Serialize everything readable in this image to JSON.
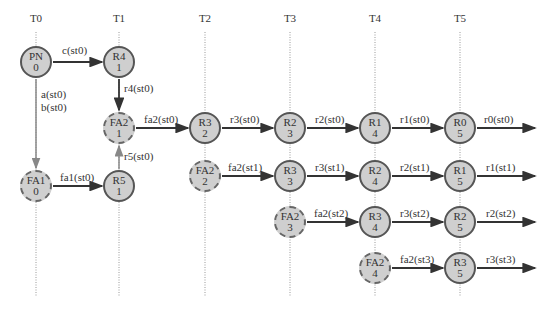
{
  "columns": [
    {
      "label": "T0",
      "x": 36
    },
    {
      "label": "T1",
      "x": 119
    },
    {
      "label": "T2",
      "x": 205
    },
    {
      "label": "T3",
      "x": 290
    },
    {
      "label": "T4",
      "x": 375
    },
    {
      "label": "T5",
      "x": 460
    }
  ],
  "nodes": [
    {
      "id": "PN0",
      "name": "PN",
      "num": "0",
      "x": 36,
      "y": 62,
      "dashed": false
    },
    {
      "id": "R4_1",
      "name": "R4",
      "num": "1",
      "x": 119,
      "y": 62,
      "dashed": false
    },
    {
      "id": "FA2_1",
      "name": "FA2",
      "num": "1",
      "x": 119,
      "y": 128,
      "dashed": true
    },
    {
      "id": "FA1_0",
      "name": "FA1",
      "num": "0",
      "x": 36,
      "y": 186,
      "dashed": true
    },
    {
      "id": "R5_1",
      "name": "R5",
      "num": "1",
      "x": 119,
      "y": 186,
      "dashed": false
    },
    {
      "id": "R3_2",
      "name": "R3",
      "num": "2",
      "x": 205,
      "y": 128,
      "dashed": false
    },
    {
      "id": "FA2_2",
      "name": "FA2",
      "num": "2",
      "x": 205,
      "y": 176,
      "dashed": true
    },
    {
      "id": "R2_3",
      "name": "R2",
      "num": "3",
      "x": 290,
      "y": 128,
      "dashed": false
    },
    {
      "id": "R3_3",
      "name": "R3",
      "num": "3",
      "x": 290,
      "y": 176,
      "dashed": false
    },
    {
      "id": "FA2_3",
      "name": "FA2",
      "num": "3",
      "x": 290,
      "y": 222,
      "dashed": true
    },
    {
      "id": "R1_4",
      "name": "R1",
      "num": "4",
      "x": 375,
      "y": 128,
      "dashed": false
    },
    {
      "id": "R2_4",
      "name": "R2",
      "num": "4",
      "x": 375,
      "y": 176,
      "dashed": false
    },
    {
      "id": "R3_4",
      "name": "R3",
      "num": "4",
      "x": 375,
      "y": 222,
      "dashed": false
    },
    {
      "id": "FA2_4",
      "name": "FA2",
      "num": "4",
      "x": 375,
      "y": 268,
      "dashed": true
    },
    {
      "id": "R0_5",
      "name": "R0",
      "num": "5",
      "x": 460,
      "y": 128,
      "dashed": false
    },
    {
      "id": "R1_5",
      "name": "R1",
      "num": "5",
      "x": 460,
      "y": 176,
      "dashed": false
    },
    {
      "id": "R2_5",
      "name": "R2",
      "num": "5",
      "x": 460,
      "y": 222,
      "dashed": false
    },
    {
      "id": "R3_5",
      "name": "R3",
      "num": "5",
      "x": 460,
      "y": 268,
      "dashed": false
    }
  ],
  "edges": [
    {
      "label": "c(st0)",
      "x1": 53,
      "y1": 62,
      "x2": 102,
      "y2": 62,
      "lx": 62,
      "ly": 44
    },
    {
      "label": "r4(st0)",
      "x1": 119,
      "y1": 79,
      "x2": 119,
      "y2": 110,
      "lx": 124,
      "ly": 82
    },
    {
      "label": "a(st0)",
      "x1": 36,
      "y1": 79,
      "x2": 36,
      "y2": 168,
      "lx": 41,
      "ly": 88,
      "gray": true
    },
    {
      "label": "b(st0)",
      "x1": 0,
      "y1": 0,
      "x2": 0,
      "y2": 0,
      "lx": 41,
      "ly": 101,
      "hidden": true
    },
    {
      "label": "fa1(st0)",
      "x1": 53,
      "y1": 186,
      "x2": 102,
      "y2": 186,
      "lx": 60,
      "ly": 171
    },
    {
      "label": "r5(st0)",
      "x1": 119,
      "y1": 169,
      "x2": 119,
      "y2": 146,
      "lx": 124,
      "ly": 150,
      "gray": true
    },
    {
      "label": "fa2(st0)",
      "x1": 136,
      "y1": 128,
      "x2": 188,
      "y2": 128,
      "lx": 144,
      "ly": 113
    },
    {
      "label": "r3(st0)",
      "x1": 222,
      "y1": 128,
      "x2": 273,
      "y2": 128,
      "lx": 230,
      "ly": 113
    },
    {
      "label": "r2(st0)",
      "x1": 307,
      "y1": 128,
      "x2": 358,
      "y2": 128,
      "lx": 315,
      "ly": 113
    },
    {
      "label": "r1(st0)",
      "x1": 392,
      "y1": 128,
      "x2": 443,
      "y2": 128,
      "lx": 400,
      "ly": 113
    },
    {
      "label": "r0(st0)",
      "x1": 477,
      "y1": 128,
      "x2": 535,
      "y2": 128,
      "lx": 484,
      "ly": 113
    },
    {
      "label": "fa2(st1)",
      "x1": 222,
      "y1": 176,
      "x2": 273,
      "y2": 176,
      "lx": 228,
      "ly": 161
    },
    {
      "label": "r3(st1)",
      "x1": 307,
      "y1": 176,
      "x2": 358,
      "y2": 176,
      "lx": 315,
      "ly": 161
    },
    {
      "label": "r2(st1)",
      "x1": 392,
      "y1": 176,
      "x2": 443,
      "y2": 176,
      "lx": 400,
      "ly": 161
    },
    {
      "label": "r1(st1)",
      "x1": 477,
      "y1": 176,
      "x2": 535,
      "y2": 176,
      "lx": 486,
      "ly": 161
    },
    {
      "label": "fa2(st2)",
      "x1": 307,
      "y1": 222,
      "x2": 358,
      "y2": 222,
      "lx": 314,
      "ly": 207
    },
    {
      "label": "r3(st2)",
      "x1": 392,
      "y1": 222,
      "x2": 443,
      "y2": 222,
      "lx": 400,
      "ly": 207
    },
    {
      "label": "r2(st2)",
      "x1": 477,
      "y1": 222,
      "x2": 535,
      "y2": 222,
      "lx": 486,
      "ly": 207
    },
    {
      "label": "fa2(st3)",
      "x1": 392,
      "y1": 268,
      "x2": 443,
      "y2": 268,
      "lx": 400,
      "ly": 253
    },
    {
      "label": "r3(st3)",
      "x1": 477,
      "y1": 268,
      "x2": 535,
      "y2": 268,
      "lx": 486,
      "ly": 253
    }
  ]
}
